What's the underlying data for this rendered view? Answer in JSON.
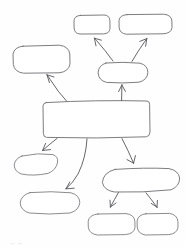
{
  "document": {
    "kind": "hand-drawn concept map sketch",
    "title": "",
    "background_color": "#fefefe",
    "stroke_color": "#6e6e72",
    "connector_color": "#55555a",
    "width": 185,
    "height": 247,
    "has_text_labels": false,
    "note": "All nodes are blank; no lettering is rendered in the drawing."
  },
  "diagram": {
    "layout": "radial tree descending from a central rectangle",
    "node_count": 10,
    "edge_count": 9,
    "nodes": [
      {
        "id": "top-left-pill",
        "label": "",
        "shape": "rounded-rectangle",
        "x": 74,
        "y": 15,
        "w": 36,
        "h": 19,
        "row": "top"
      },
      {
        "id": "top-right-pill",
        "label": "",
        "shape": "rounded-rectangle",
        "x": 119,
        "y": 14,
        "w": 53,
        "h": 20,
        "row": "top"
      },
      {
        "id": "left-oval",
        "label": "",
        "shape": "rounded-rectangle",
        "x": 13,
        "y": 45,
        "w": 57,
        "h": 28,
        "row": "upper"
      },
      {
        "id": "mid-right-oval",
        "label": "",
        "shape": "oval",
        "x": 98,
        "y": 62,
        "w": 50,
        "h": 21,
        "row": "upper"
      },
      {
        "id": "center-rectangle",
        "label": "",
        "shape": "rectangle",
        "x": 43,
        "y": 100,
        "w": 107,
        "h": 38,
        "row": "center",
        "is_hub": true
      },
      {
        "id": "lower-left-blob",
        "label": "",
        "shape": "blob",
        "x": 14,
        "y": 153,
        "w": 44,
        "h": 22,
        "row": "lower"
      },
      {
        "id": "lower-left-oval",
        "label": "",
        "shape": "oval",
        "x": 20,
        "y": 192,
        "w": 60,
        "h": 22,
        "row": "lower"
      },
      {
        "id": "lower-right-big",
        "label": "",
        "shape": "rounded-rectangle",
        "x": 102,
        "y": 168,
        "w": 78,
        "h": 25,
        "row": "lower"
      },
      {
        "id": "bottom-left-pill",
        "label": "",
        "shape": "rounded-rectangle",
        "x": 88,
        "y": 213,
        "w": 47,
        "h": 22,
        "row": "bottom"
      },
      {
        "id": "bottom-right-pill",
        "label": "",
        "shape": "rounded-rectangle",
        "x": 137,
        "y": 213,
        "w": 41,
        "h": 22,
        "row": "bottom"
      }
    ],
    "edges": [
      {
        "id": "edge-hub-to-left-oval",
        "from": "center-rectangle",
        "to": "left-oval",
        "style": "curved-arrow",
        "direction": "up-left"
      },
      {
        "id": "edge-hub-to-mid-right-oval",
        "from": "center-rectangle",
        "to": "mid-right-oval",
        "style": "straight-arrow",
        "direction": "up"
      },
      {
        "id": "edge-mid-to-top-left-pill",
        "from": "mid-right-oval",
        "to": "top-left-pill",
        "style": "curved-arrow",
        "direction": "up-left"
      },
      {
        "id": "edge-mid-to-top-right-pill",
        "from": "mid-right-oval",
        "to": "top-right-pill",
        "style": "curved-arrow",
        "direction": "up-right"
      },
      {
        "id": "edge-hub-to-lower-left-blob",
        "from": "center-rectangle",
        "to": "lower-left-blob",
        "style": "straight-arrow",
        "direction": "down-left"
      },
      {
        "id": "edge-hub-to-lower-left-oval",
        "from": "center-rectangle",
        "to": "lower-left-oval",
        "style": "curved-arrow",
        "direction": "down"
      },
      {
        "id": "edge-hub-to-lower-right-big",
        "from": "center-rectangle",
        "to": "lower-right-big",
        "style": "curved-arrow",
        "direction": "down-right"
      },
      {
        "id": "edge-big-to-bottom-left-pill",
        "from": "lower-right-big",
        "to": "bottom-left-pill",
        "style": "straight-arrow",
        "direction": "down-left"
      },
      {
        "id": "edge-big-to-bottom-right-pill",
        "from": "lower-right-big",
        "to": "bottom-right-pill",
        "style": "straight-arrow",
        "direction": "down-right"
      }
    ]
  }
}
